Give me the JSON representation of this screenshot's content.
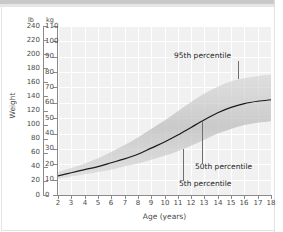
{
  "chart_data": {
    "type": "line",
    "title": "",
    "subtitle": "",
    "xlabel": "Age (years)",
    "ylabel": "Weight",
    "xlim": [
      2,
      18
    ],
    "ylim_lb": [
      0,
      240
    ],
    "ylim_kg": [
      0,
      110
    ],
    "grid": true,
    "legend_position": "none",
    "unit_left_outer": "lb",
    "unit_left_inner": "kg",
    "x_ticks": [
      2,
      3,
      4,
      5,
      6,
      7,
      8,
      9,
      10,
      11,
      12,
      13,
      14,
      15,
      16,
      17,
      18
    ],
    "y_ticks_lb": [
      0,
      20,
      40,
      60,
      80,
      100,
      120,
      140,
      160,
      180,
      200,
      220,
      240
    ],
    "y_ticks_kg": [
      0,
      10,
      20,
      30,
      40,
      50,
      60,
      70,
      80,
      90,
      100,
      110
    ],
    "x": [
      2,
      3,
      4,
      5,
      6,
      7,
      8,
      9,
      10,
      11,
      12,
      13,
      14,
      15,
      16,
      17,
      18
    ],
    "series": [
      {
        "name": "5th percentile",
        "unit": "kg",
        "values": [
          10.5,
          12.0,
          13.5,
          15.0,
          16.5,
          18.5,
          20.5,
          23.0,
          25.5,
          28.5,
          32.0,
          36.0,
          40.0,
          43.0,
          45.5,
          47.0,
          48.0
        ]
      },
      {
        "name": "50th percentile",
        "unit": "kg",
        "values": [
          12.5,
          14.5,
          16.5,
          18.5,
          21.0,
          23.5,
          26.5,
          30.5,
          34.5,
          39.0,
          44.0,
          49.0,
          53.5,
          57.0,
          59.5,
          61.0,
          62.0
        ]
      },
      {
        "name": "95th percentile",
        "unit": "kg",
        "values": [
          15.0,
          17.5,
          20.5,
          24.0,
          28.0,
          32.5,
          37.5,
          43.0,
          48.5,
          54.5,
          60.5,
          66.0,
          70.5,
          74.0,
          76.0,
          77.5,
          78.5
        ]
      }
    ],
    "annotations": [
      {
        "label": "95th percentile",
        "points_to_series": "95th percentile",
        "points_to_x": 15.5
      },
      {
        "label": "50th percentile",
        "points_to_series": "50th percentile",
        "points_to_x": 12.8
      },
      {
        "label": "5th percentile",
        "points_to_series": "5th percentile",
        "points_to_x": 11.4
      }
    ]
  }
}
